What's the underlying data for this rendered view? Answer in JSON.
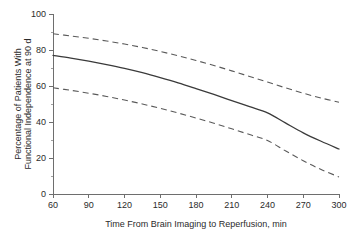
{
  "chart_data": {
    "type": "line",
    "title": "",
    "xlabel": "Time From Brain Imaging to Reperfusion, min",
    "ylabel_line1": "Percentage of Patients With",
    "ylabel_line2": "Functional Independence at 90 d",
    "xlim": [
      60,
      300
    ],
    "ylim": [
      0,
      100
    ],
    "xticks": [
      60,
      90,
      120,
      150,
      180,
      210,
      240,
      270,
      300
    ],
    "xtick_labels": [
      "60",
      "90",
      "120",
      "150",
      "180",
      "210",
      "240",
      "270",
      "300"
    ],
    "yticks": [
      0,
      20,
      40,
      60,
      80,
      100
    ],
    "ytick_labels": [
      "0",
      "20",
      "40",
      "60",
      "80",
      "100"
    ],
    "yticks_minor": [
      10,
      30,
      50,
      70,
      90
    ],
    "grid": false,
    "legend": "none",
    "x": [
      60,
      75,
      90,
      105,
      120,
      135,
      150,
      165,
      180,
      195,
      210,
      225,
      240,
      255,
      270,
      285,
      300
    ],
    "series": [
      {
        "name": "Upper 95% CI",
        "style": "dashed",
        "color": "#5a5a5a",
        "values": [
          89.0,
          87.8,
          86.5,
          85.0,
          83.3,
          81.4,
          79.2,
          76.8,
          74.2,
          71.4,
          68.4,
          65.3,
          62.2,
          59.0,
          56.0,
          53.3,
          51.0
        ]
      },
      {
        "name": "Point estimate",
        "style": "solid",
        "color": "#3a3a3a",
        "values": [
          77.0,
          75.5,
          73.8,
          71.9,
          69.8,
          67.4,
          64.7,
          61.8,
          58.6,
          55.3,
          51.9,
          48.5,
          45.1,
          39.5,
          34.0,
          29.3,
          25.0
        ]
      },
      {
        "name": "Lower 95% CI",
        "style": "dashed",
        "color": "#5a5a5a",
        "values": [
          59.0,
          57.6,
          56.0,
          54.2,
          52.2,
          50.0,
          47.6,
          45.0,
          42.2,
          39.3,
          36.2,
          33.0,
          29.7,
          24.0,
          18.5,
          13.6,
          9.5
        ]
      }
    ]
  }
}
